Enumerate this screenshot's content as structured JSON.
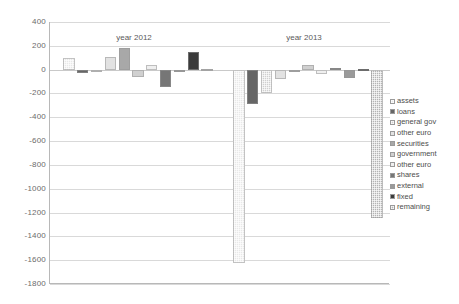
{
  "chart_data": {
    "type": "bar",
    "title": "",
    "xlabel": "",
    "ylabel": "",
    "ylim": [
      -1800,
      400
    ],
    "ytick_step": 200,
    "grid": true,
    "legend_position": "right",
    "yticks": [
      "400",
      "200",
      "0",
      "-200",
      "-400",
      "-600",
      "-800",
      "-1000",
      "-1200",
      "-1400",
      "-1600",
      "-1800"
    ],
    "categories": [
      "year 2012",
      "year 2013"
    ],
    "series": [
      {
        "name": "assets",
        "color": "#e8e8e8",
        "pattern": "dots",
        "values": [
          95,
          -1620
        ]
      },
      {
        "name": "loans",
        "color": "#666666",
        "pattern": "solid",
        "values": [
          -30,
          -285
        ]
      },
      {
        "name": "general gov",
        "color": "#cfcfcf",
        "pattern": "dots",
        "values": [
          -15,
          -200
        ]
      },
      {
        "name": "other euro",
        "color": "#e2e2e2",
        "pattern": "solid",
        "values": [
          110,
          -80
        ]
      },
      {
        "name": "securities",
        "color": "#a8a8a8",
        "pattern": "solid",
        "values": [
          180,
          -20
        ]
      },
      {
        "name": "government",
        "color": "#d0d0d0",
        "pattern": "solid",
        "values": [
          -60,
          40
        ]
      },
      {
        "name": "other euro",
        "color": "#efefef",
        "pattern": "solid",
        "values": [
          35,
          -40
        ]
      },
      {
        "name": "shares",
        "color": "#767676",
        "pattern": "solid",
        "values": [
          -150,
          15
        ]
      },
      {
        "name": "external",
        "color": "#9a9a9a",
        "pattern": "solid",
        "values": [
          -20,
          -70
        ]
      },
      {
        "name": "fixed",
        "color": "#3b3b3b",
        "pattern": "solid",
        "values": [
          145,
          4
        ]
      },
      {
        "name": "remaining",
        "color": "#b4b4b4",
        "pattern": "dots",
        "values": [
          2,
          -1250
        ]
      }
    ]
  },
  "legend": {
    "items": [
      {
        "label": "assets"
      },
      {
        "label": "loans"
      },
      {
        "label": "general gov"
      },
      {
        "label": "other euro"
      },
      {
        "label": "securities"
      },
      {
        "label": "government"
      },
      {
        "label": "other euro"
      },
      {
        "label": "shares"
      },
      {
        "label": "external"
      },
      {
        "label": "fixed"
      },
      {
        "label": "remaining"
      }
    ]
  }
}
